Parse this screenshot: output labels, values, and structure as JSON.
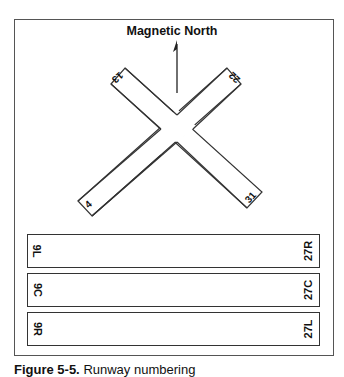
{
  "figure": {
    "title": "Magnetic North",
    "caption_label": "Figure 5-5.",
    "caption_text": "Runway numbering"
  },
  "crossing_runways": [
    {
      "id": "13-31",
      "ends": [
        "13",
        "31"
      ]
    },
    {
      "id": "4-22",
      "ends": [
        "4",
        "22"
      ]
    }
  ],
  "parallel_runways": [
    {
      "left": "9L",
      "right": "27R"
    },
    {
      "left": "9C",
      "right": "27C"
    },
    {
      "left": "9R",
      "right": "27L"
    }
  ],
  "colors": {
    "stroke": "#333333",
    "background": "#ffffff",
    "text": "#111111"
  }
}
